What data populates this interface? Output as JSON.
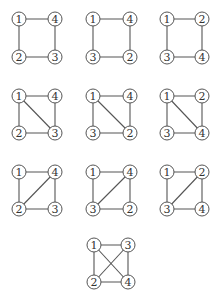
{
  "diagram": {
    "style": {
      "edge_color": "#555555",
      "node_stroke": "#555555",
      "node_fill": "#ffffff",
      "label_color": "#333333",
      "node_radius": 7
    },
    "graphs": [
      {
        "id": "g1",
        "origin": [
          19,
          19
        ],
        "size": [
          36,
          38
        ],
        "corners": {
          "tl": "1",
          "tr": "4",
          "bl": "2",
          "br": "3"
        },
        "edges": [
          [
            "tl",
            "tr"
          ],
          [
            "tl",
            "bl"
          ],
          [
            "bl",
            "br"
          ],
          [
            "tr",
            "br"
          ]
        ]
      },
      {
        "id": "g2",
        "origin": [
          93,
          19
        ],
        "size": [
          37,
          38
        ],
        "corners": {
          "tl": "1",
          "tr": "4",
          "bl": "3",
          "br": "2"
        },
        "edges": [
          [
            "tl",
            "tr"
          ],
          [
            "tl",
            "bl"
          ],
          [
            "bl",
            "br"
          ],
          [
            "tr",
            "br"
          ]
        ]
      },
      {
        "id": "g3",
        "origin": [
          167,
          19
        ],
        "size": [
          35,
          38
        ],
        "corners": {
          "tl": "1",
          "tr": "2",
          "bl": "3",
          "br": "4"
        },
        "edges": [
          [
            "tl",
            "tr"
          ],
          [
            "tl",
            "bl"
          ],
          [
            "bl",
            "br"
          ],
          [
            "tr",
            "br"
          ]
        ]
      },
      {
        "id": "g4",
        "origin": [
          19,
          96
        ],
        "size": [
          36,
          37
        ],
        "corners": {
          "tl": "1",
          "tr": "4",
          "bl": "2",
          "br": "3"
        },
        "edges": [
          [
            "tl",
            "tr"
          ],
          [
            "tl",
            "bl"
          ],
          [
            "bl",
            "br"
          ],
          [
            "tr",
            "br"
          ],
          [
            "tl",
            "br"
          ]
        ]
      },
      {
        "id": "g5",
        "origin": [
          93,
          96
        ],
        "size": [
          37,
          37
        ],
        "corners": {
          "tl": "1",
          "tr": "4",
          "bl": "3",
          "br": "2"
        },
        "edges": [
          [
            "tl",
            "tr"
          ],
          [
            "tl",
            "bl"
          ],
          [
            "bl",
            "br"
          ],
          [
            "tr",
            "br"
          ],
          [
            "tl",
            "br"
          ]
        ]
      },
      {
        "id": "g6",
        "origin": [
          167,
          96
        ],
        "size": [
          35,
          37
        ],
        "corners": {
          "tl": "1",
          "tr": "2",
          "bl": "3",
          "br": "4"
        },
        "edges": [
          [
            "tl",
            "tr"
          ],
          [
            "tl",
            "bl"
          ],
          [
            "bl",
            "br"
          ],
          [
            "tr",
            "br"
          ],
          [
            "tl",
            "br"
          ]
        ]
      },
      {
        "id": "g7",
        "origin": [
          19,
          172
        ],
        "size": [
          36,
          37
        ],
        "corners": {
          "tl": "1",
          "tr": "4",
          "bl": "2",
          "br": "3"
        },
        "edges": [
          [
            "tl",
            "tr"
          ],
          [
            "tl",
            "bl"
          ],
          [
            "bl",
            "br"
          ],
          [
            "tr",
            "br"
          ],
          [
            "tr",
            "bl"
          ]
        ]
      },
      {
        "id": "g8",
        "origin": [
          93,
          172
        ],
        "size": [
          37,
          37
        ],
        "corners": {
          "tl": "1",
          "tr": "4",
          "bl": "3",
          "br": "2"
        },
        "edges": [
          [
            "tl",
            "tr"
          ],
          [
            "tl",
            "bl"
          ],
          [
            "bl",
            "br"
          ],
          [
            "tr",
            "br"
          ],
          [
            "tr",
            "bl"
          ]
        ]
      },
      {
        "id": "g9",
        "origin": [
          167,
          172
        ],
        "size": [
          35,
          37
        ],
        "corners": {
          "tl": "1",
          "tr": "2",
          "bl": "3",
          "br": "4"
        },
        "edges": [
          [
            "tl",
            "tr"
          ],
          [
            "tl",
            "bl"
          ],
          [
            "bl",
            "br"
          ],
          [
            "tr",
            "br"
          ],
          [
            "tr",
            "bl"
          ]
        ]
      },
      {
        "id": "g10",
        "origin": [
          94,
          245
        ],
        "size": [
          34,
          37
        ],
        "corners": {
          "tl": "1",
          "tr": "3",
          "bl": "2",
          "br": "4"
        },
        "edges": [
          [
            "tl",
            "tr"
          ],
          [
            "tl",
            "bl"
          ],
          [
            "bl",
            "br"
          ],
          [
            "tr",
            "br"
          ],
          [
            "tl",
            "br"
          ],
          [
            "tr",
            "bl"
          ]
        ]
      }
    ]
  }
}
